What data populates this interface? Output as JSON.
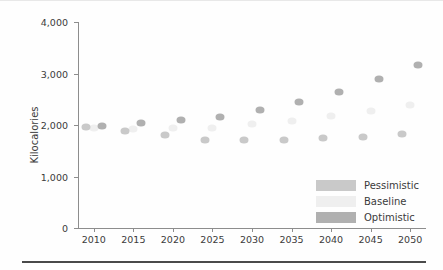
{
  "chart_data": {
    "type": "scatter",
    "title": "",
    "xlabel": "",
    "ylabel": "Kilocalories",
    "xlim": [
      2008,
      2052
    ],
    "ylim": [
      0,
      4000
    ],
    "grid": false,
    "legend_position": "bottom-right",
    "ytick_labels": [
      "0",
      "1,000",
      "2,000",
      "3,000",
      "4,000"
    ],
    "ytick_values": [
      0,
      1000,
      2000,
      3000,
      4000
    ],
    "xtick_labels": [
      "2010",
      "2015",
      "2020",
      "2025",
      "2030",
      "2035",
      "2040",
      "2045",
      "2050"
    ],
    "xtick_values": [
      2010,
      2015,
      2020,
      2025,
      2030,
      2035,
      2040,
      2045,
      2050
    ],
    "x": [
      2009,
      2011,
      2014,
      2016,
      2019,
      2021,
      2024,
      2026,
      2029,
      2031,
      2034,
      2036,
      2039,
      2041,
      2044,
      2046,
      2049,
      2051
    ],
    "series": [
      {
        "name": "Pessimistic",
        "color": "#c9c9c9",
        "values": [
          1960,
          1985,
          1885,
          1915,
          1810,
          1950,
          1715,
          1945,
          1710,
          2010,
          1715,
          2085,
          1745,
          2170,
          1775,
          2265,
          1820,
          2390
        ]
      },
      {
        "name": "Baseline",
        "color": "#efefef",
        "values": [
          1955,
          1982,
          1900,
          1930,
          1880,
          1960,
          1800,
          1950,
          1790,
          2005,
          1800,
          2090,
          1810,
          2175,
          1830,
          2270,
          1850,
          2395
        ]
      },
      {
        "name": "Optimistic",
        "color": "#b0b0b0",
        "values": [
          1965,
          1990,
          1890,
          2035,
          1820,
          2105,
          1720,
          2150,
          1715,
          2290,
          1725,
          2450,
          1750,
          2650,
          1780,
          2900,
          1825,
          3160
        ]
      }
    ],
    "points": [
      {
        "series": "Pessimistic",
        "x": 2009,
        "y": 1955
      },
      {
        "series": "Baseline",
        "x": 2010,
        "y": 1945
      },
      {
        "series": "Optimistic",
        "x": 2011,
        "y": 1985
      },
      {
        "series": "Pessimistic",
        "x": 2014,
        "y": 1885
      },
      {
        "series": "Baseline",
        "x": 2015,
        "y": 1915
      },
      {
        "series": "Optimistic",
        "x": 2016,
        "y": 2035
      },
      {
        "series": "Pessimistic",
        "x": 2019,
        "y": 1810
      },
      {
        "series": "Baseline",
        "x": 2020,
        "y": 1950
      },
      {
        "series": "Optimistic",
        "x": 2021,
        "y": 2105
      },
      {
        "series": "Pessimistic",
        "x": 2024,
        "y": 1715
      },
      {
        "series": "Baseline",
        "x": 2025,
        "y": 1945
      },
      {
        "series": "Optimistic",
        "x": 2026,
        "y": 2150
      },
      {
        "series": "Pessimistic",
        "x": 2029,
        "y": 1710
      },
      {
        "series": "Baseline",
        "x": 2030,
        "y": 2010
      },
      {
        "series": "Optimistic",
        "x": 2031,
        "y": 2290
      },
      {
        "series": "Pessimistic",
        "x": 2034,
        "y": 1715
      },
      {
        "series": "Baseline",
        "x": 2035,
        "y": 2085
      },
      {
        "series": "Optimistic",
        "x": 2036,
        "y": 2450
      },
      {
        "series": "Pessimistic",
        "x": 2039,
        "y": 1745
      },
      {
        "series": "Baseline",
        "x": 2040,
        "y": 2170
      },
      {
        "series": "Optimistic",
        "x": 2041,
        "y": 2650
      },
      {
        "series": "Pessimistic",
        "x": 2044,
        "y": 1775
      },
      {
        "series": "Baseline",
        "x": 2045,
        "y": 2265
      },
      {
        "series": "Optimistic",
        "x": 2046,
        "y": 2900
      },
      {
        "series": "Pessimistic",
        "x": 2049,
        "y": 1820
      },
      {
        "series": "Baseline",
        "x": 2050,
        "y": 2390
      },
      {
        "series": "Optimistic",
        "x": 2051,
        "y": 3160
      }
    ]
  },
  "legend": {
    "items": [
      {
        "label": "Pessimistic",
        "color": "#c9c9c9"
      },
      {
        "label": "Baseline",
        "color": "#efefef"
      },
      {
        "label": "Optimistic",
        "color": "#b0b0b0"
      }
    ]
  }
}
